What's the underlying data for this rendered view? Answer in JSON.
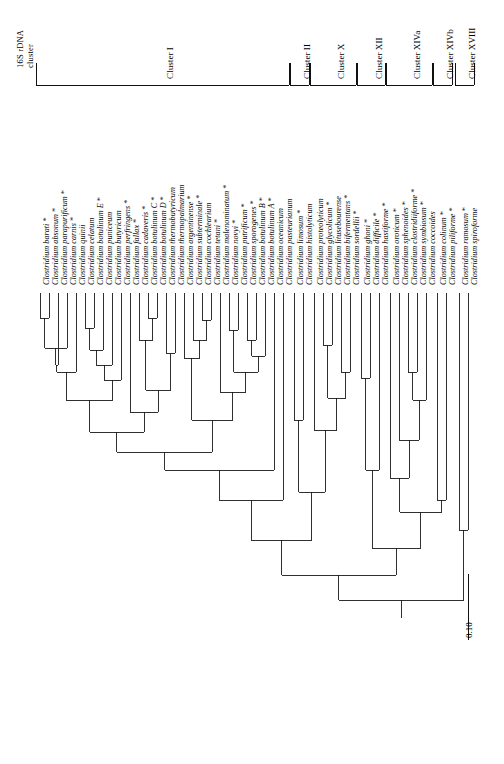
{
  "figure": {
    "type": "phylogenetic-tree",
    "orientation": "rotated-90-ccw",
    "header_title_line1": "16S rDNA",
    "header_title_line2": "cluster",
    "scale_label": "0.10",
    "asterisk_marker": "*",
    "line_color": "#1a1a1a",
    "background": "#ffffff"
  },
  "clusters": [
    {
      "name": "Cluster I",
      "label": "Cluster I"
    },
    {
      "name": "Cluster II",
      "label": "Cluster II"
    },
    {
      "name": "Cluster X",
      "label": "Cluster X"
    },
    {
      "name": "Cluster XII",
      "label": "Cluster XII"
    },
    {
      "name": "Cluster XIVa",
      "label": "Cluster XIVa"
    },
    {
      "name": "Cluster XIVb",
      "label": "Cluster XIVb"
    },
    {
      "name": "Cluster XVIII",
      "label": "Cluster XVIII"
    }
  ],
  "taxa": [
    {
      "name": "Clostridium barati",
      "starred": true,
      "cluster": "Cluster I"
    },
    {
      "name": "Clostridium absonum",
      "starred": true,
      "cluster": "Cluster I"
    },
    {
      "name": "Clostridium parapurificum",
      "starred": true,
      "cluster": "Cluster I"
    },
    {
      "name": "Clostridium carnis",
      "starred": true,
      "cluster": "Cluster I"
    },
    {
      "name": "Clostridium quinii",
      "starred": false,
      "cluster": "Cluster I"
    },
    {
      "name": "Clostridium celatum",
      "starred": false,
      "cluster": "Cluster I"
    },
    {
      "name": "Clostridium botulinum E",
      "starred": true,
      "cluster": "Cluster I"
    },
    {
      "name": "Clostridium puniceum",
      "starred": false,
      "cluster": "Cluster I"
    },
    {
      "name": "Clostridium butyricum",
      "starred": false,
      "cluster": "Cluster I"
    },
    {
      "name": "Clostridium perfringens",
      "starred": true,
      "cluster": "Cluster I"
    },
    {
      "name": "Clostridium fallax",
      "starred": true,
      "cluster": "Cluster I"
    },
    {
      "name": "Clostridium cadaveris",
      "starred": true,
      "cluster": "Cluster I"
    },
    {
      "name": "Clostridium botulinum C",
      "starred": true,
      "cluster": "Cluster I"
    },
    {
      "name": "Clostridium botulinum D",
      "starred": true,
      "cluster": "Cluster I"
    },
    {
      "name": "Clostridium thermobutyricum",
      "starred": false,
      "cluster": "Cluster I"
    },
    {
      "name": "Clostridium thermopalmarium",
      "starred": false,
      "cluster": "Cluster I"
    },
    {
      "name": "Clostridium argentinense",
      "starred": true,
      "cluster": "Cluster I"
    },
    {
      "name": "Clostridium subterminale",
      "starred": true,
      "cluster": "Cluster I"
    },
    {
      "name": "Clostridium cochlearium",
      "starred": false,
      "cluster": "Cluster I"
    },
    {
      "name": "Clostridium tetani",
      "starred": true,
      "cluster": "Cluster I"
    },
    {
      "name": "Clostridium malenominatum",
      "starred": true,
      "cluster": "Cluster I"
    },
    {
      "name": "Clostridium novyi",
      "starred": true,
      "cluster": "Cluster I"
    },
    {
      "name": "Clostridium putrificum",
      "starred": true,
      "cluster": "Cluster I"
    },
    {
      "name": "Clostridium sporogenes",
      "starred": true,
      "cluster": "Cluster I"
    },
    {
      "name": "Clostridium botulinum B",
      "starred": true,
      "cluster": "Cluster I"
    },
    {
      "name": "Clostridium botulinum A",
      "starred": true,
      "cluster": "Cluster I"
    },
    {
      "name": "Clostridium oceanicum",
      "starred": false,
      "cluster": "Cluster I"
    },
    {
      "name": "Clostridium pasteurianum",
      "starred": false,
      "cluster": "Cluster I"
    },
    {
      "name": "Clostridium limosum",
      "starred": true,
      "cluster": "Cluster II"
    },
    {
      "name": "Clostridium histolyticum",
      "starred": false,
      "cluster": "Cluster II"
    },
    {
      "name": "Clostridium proteolyticum",
      "starred": false,
      "cluster": "Cluster X"
    },
    {
      "name": "Clostridium glycolicum",
      "starred": true,
      "cluster": "Cluster X"
    },
    {
      "name": "Clostridium litusebourense",
      "starred": false,
      "cluster": "Cluster X"
    },
    {
      "name": "Clostridium bifermentans",
      "starred": true,
      "cluster": "Cluster X"
    },
    {
      "name": "Clostridium sordellii",
      "starred": true,
      "cluster": "Cluster X"
    },
    {
      "name": "Clostridium ghoni",
      "starred": true,
      "cluster": "Cluster XII"
    },
    {
      "name": "Clostridium difficile",
      "starred": true,
      "cluster": "Cluster XII"
    },
    {
      "name": "Clostridium hastiforme",
      "starred": true,
      "cluster": "Cluster XII"
    },
    {
      "name": "Clostridium oroticum",
      "starred": true,
      "cluster": "Cluster XIVa"
    },
    {
      "name": "Clostridium sphenoides",
      "starred": true,
      "cluster": "Cluster XIVa"
    },
    {
      "name": "Clostridium clostridiiforme",
      "starred": true,
      "cluster": "Cluster XIVa"
    },
    {
      "name": "Clostridium symbiosum",
      "starred": true,
      "cluster": "Cluster XIVa"
    },
    {
      "name": "Clostridium coccoides",
      "starred": false,
      "cluster": "Cluster XIVa"
    },
    {
      "name": "Clostridium colinum",
      "starred": true,
      "cluster": "Cluster XIVb"
    },
    {
      "name": "Clostridium piliforme",
      "starred": true,
      "cluster": "Cluster XIVb"
    },
    {
      "name": "Clostridium ramosum",
      "starred": true,
      "cluster": "Cluster XVIII"
    },
    {
      "name": "Clostridium spiroforme",
      "starred": false,
      "cluster": "Cluster XVIII"
    }
  ],
  "tree_layout": {
    "tip_x": [
      40,
      49,
      58,
      67,
      76,
      85,
      94,
      103,
      112,
      121,
      130,
      139,
      148,
      157,
      166,
      175,
      184,
      193,
      202,
      211,
      220,
      229,
      238,
      247,
      256,
      265,
      274,
      283,
      294,
      303,
      314,
      323,
      332,
      341,
      350,
      361,
      370,
      379,
      390,
      399,
      408,
      417,
      426,
      437,
      446,
      459,
      468
    ],
    "tip_depth": [
      293,
      293,
      293,
      293,
      293,
      293,
      293,
      293,
      293,
      293,
      293,
      293,
      293,
      293,
      293,
      293,
      293,
      293,
      293,
      293,
      293,
      293,
      293,
      293,
      293,
      293,
      293,
      293,
      293,
      293,
      293,
      293,
      293,
      293,
      293,
      293,
      293,
      293,
      293,
      293,
      293,
      293,
      293,
      293,
      293,
      293,
      293
    ],
    "tip_stem_end": [
      318,
      318,
      308,
      332,
      348,
      328,
      328,
      350,
      330,
      345,
      345,
      335,
      318,
      318,
      353,
      353,
      345,
      335,
      320,
      320,
      355,
      330,
      318,
      340,
      340,
      345,
      380,
      400,
      345,
      345,
      340,
      318,
      345,
      340,
      328,
      345,
      345,
      358,
      380,
      380,
      340,
      328,
      355,
      345,
      345,
      400,
      400
    ],
    "scale_axis_x": 468,
    "scale_bar_y1": 574,
    "scale_bar_y2": 640
  }
}
